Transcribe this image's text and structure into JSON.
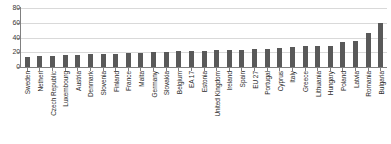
{
  "chart_data": {
    "type": "bar",
    "title": "",
    "subtitle": "",
    "xlabel": "",
    "ylabel": "",
    "ylim": [
      0,
      80
    ],
    "yticks": [
      0,
      20,
      40,
      60,
      80
    ],
    "grid": true,
    "legend": null,
    "bar_color": "#595959",
    "grid_color": "#d9d9d9",
    "axis_color": "#808080",
    "orientation": "vertical",
    "tick_label_rotation": 90,
    "categories": [
      "Sweden",
      "Netherl",
      "Czech Republic",
      "Luxembourg",
      "Austria",
      "Denmark",
      "Slovenia",
      "Finland",
      "France",
      "Malta",
      "Germany",
      "Slovakia",
      "Belgium",
      "EA 17",
      "Estonia",
      "United Kingdom",
      "Ireland",
      "Spain",
      "EU 27",
      "Portugal",
      "Cyprus",
      "Italy",
      "Greece",
      "Lithuania",
      "Hungary",
      "Poland",
      "Latvia",
      "Romania",
      "Bulgaria"
    ],
    "values": [
      14,
      15.5,
      15.5,
      16,
      16.5,
      17,
      17.5,
      17.5,
      19,
      19.5,
      20,
      21,
      21.5,
      22,
      22,
      23,
      23.5,
      23,
      24.5,
      25,
      25.5,
      26.5,
      28.5,
      28.5,
      29,
      34,
      35,
      46,
      60
    ]
  }
}
